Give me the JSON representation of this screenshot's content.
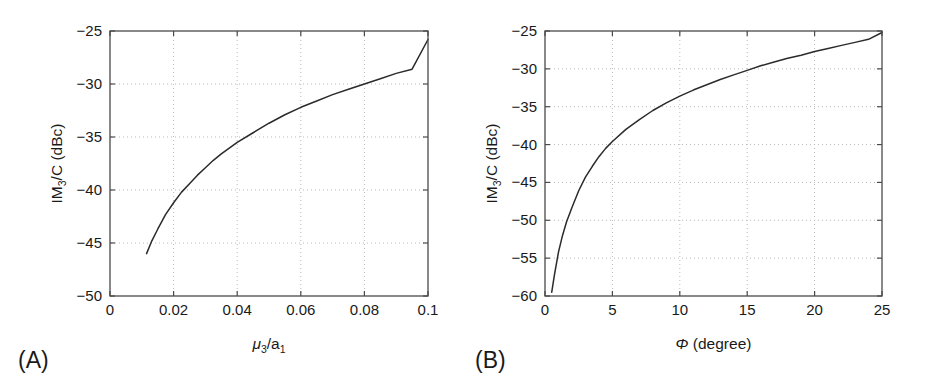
{
  "figure": {
    "width": 930,
    "height": 382,
    "background": "#ffffff",
    "curve_color": "#2b2b2b",
    "axis_color": "#4a4a4a",
    "grid_color": "#b9b9b9"
  },
  "panels": [
    {
      "tag": "(A)",
      "ylabel_main": "IM",
      "ylabel_sub": "3",
      "ylabel_rest": "/C (dBc)",
      "xlabel_sym": "μ",
      "xlabel_sub": "3",
      "xlabel_mid": "/a",
      "xlabel_sub2": "1",
      "xticklabels": [
        "0",
        "0.02",
        "0.04",
        "0.06",
        "0.08",
        "0.1"
      ],
      "yticklabels": [
        "−25",
        "−30",
        "−35",
        "−40",
        "−45",
        "−50"
      ]
    },
    {
      "tag": "(B)",
      "ylabel_main": "IM",
      "ylabel_sub": "3",
      "ylabel_rest": "/C (dBc)",
      "xlabel_sym": "Φ",
      "xlabel_rest": " (degree)",
      "xticklabels": [
        "0",
        "5",
        "10",
        "15",
        "20",
        "25"
      ],
      "yticklabels": [
        "−25",
        "−30",
        "−35",
        "−40",
        "−45",
        "−50",
        "−55",
        "−60"
      ]
    }
  ],
  "chart_data": [
    {
      "type": "line",
      "title": "",
      "panel": "(A)",
      "xlabel": "μ3/a1",
      "ylabel": "IM3/C (dBc)",
      "xlim": [
        0,
        0.1
      ],
      "ylim": [
        -50,
        -25
      ],
      "xticks": [
        0,
        0.02,
        0.04,
        0.06,
        0.08,
        0.1
      ],
      "yticks": [
        -50,
        -45,
        -40,
        -35,
        -30,
        -25
      ],
      "grid": true,
      "legend": "none",
      "series": [
        {
          "name": "IM3/C vs mu3/a1",
          "x": [
            0.0115,
            0.013,
            0.015,
            0.0175,
            0.02,
            0.0225,
            0.025,
            0.0275,
            0.03,
            0.0325,
            0.035,
            0.04,
            0.045,
            0.05,
            0.055,
            0.06,
            0.065,
            0.07,
            0.075,
            0.08,
            0.085,
            0.09,
            0.095,
            0.1
          ],
          "y": [
            -46.0,
            -44.9,
            -43.7,
            -42.3,
            -41.2,
            -40.2,
            -39.4,
            -38.6,
            -37.9,
            -37.2,
            -36.6,
            -35.5,
            -34.6,
            -33.7,
            -32.9,
            -32.2,
            -31.6,
            -31.0,
            -30.5,
            -30.0,
            -29.5,
            -29.0,
            -28.6,
            -25.8
          ]
        }
      ]
    },
    {
      "type": "line",
      "title": "",
      "panel": "(B)",
      "xlabel": "Φ (degree)",
      "ylabel": "IM3/C (dBc)",
      "xlim": [
        0,
        25
      ],
      "ylim": [
        -60,
        -25
      ],
      "xticks": [
        0,
        5,
        10,
        15,
        20,
        25
      ],
      "yticks": [
        -60,
        -55,
        -50,
        -45,
        -40,
        -35,
        -30,
        -25
      ],
      "grid": true,
      "legend": "none",
      "series": [
        {
          "name": "IM3/C vs Phi",
          "x": [
            0.5,
            0.7,
            1.0,
            1.3,
            1.6,
            2.0,
            2.5,
            3.0,
            3.5,
            4.0,
            4.5,
            5.0,
            6.0,
            7.0,
            8.0,
            9.0,
            10.0,
            11.0,
            12.0,
            13.0,
            14.0,
            15.0,
            16.0,
            17.0,
            18.0,
            19.0,
            20.0,
            21.0,
            22.0,
            23.0,
            24.0,
            25.0
          ],
          "y": [
            -59.5,
            -57.2,
            -54.2,
            -52.0,
            -50.2,
            -48.3,
            -46.1,
            -44.3,
            -42.9,
            -41.6,
            -40.5,
            -39.6,
            -38.0,
            -36.7,
            -35.5,
            -34.5,
            -33.6,
            -32.8,
            -32.1,
            -31.4,
            -30.8,
            -30.2,
            -29.6,
            -29.1,
            -28.6,
            -28.2,
            -27.7,
            -27.3,
            -26.9,
            -26.5,
            -26.1,
            -25.2
          ]
        }
      ]
    }
  ]
}
